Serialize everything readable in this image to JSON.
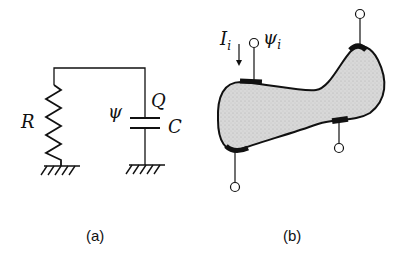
{
  "panels": {
    "a": {
      "caption": "(a)",
      "labels": {
        "resistor": "R",
        "potential": "ψ",
        "charge": "Q",
        "capacitance": "C"
      }
    },
    "b": {
      "caption": "(b)",
      "labels": {
        "current": "I",
        "current_sub": "i",
        "potential": "ψ",
        "potential_sub": "i"
      },
      "electrode_count": 4
    }
  },
  "colors": {
    "ink": "#111111",
    "body_fill": "#d6d6d6",
    "background": "#ffffff"
  }
}
